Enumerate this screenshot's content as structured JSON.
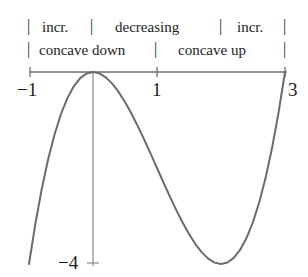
{
  "figure": {
    "curve_color": "#6b6b6b",
    "axis_color": "#6e6e6e",
    "text_color": "#1c1c1c"
  },
  "annotations": {
    "row1": [
      {
        "label": "incr.",
        "from": -1,
        "to": 0
      },
      {
        "label": "decreasing",
        "from": 0,
        "to": 2
      },
      {
        "label": "incr.",
        "from": 2,
        "to": 3
      }
    ],
    "row2": [
      {
        "label": "concave down",
        "from": -1,
        "to": 1
      },
      {
        "label": "concave up",
        "from": 1,
        "to": 3
      }
    ],
    "divider_glyph": "|"
  },
  "axes": {
    "x_ticks": [
      {
        "value": -1,
        "label": "−1"
      },
      {
        "value": 1,
        "label": "1"
      },
      {
        "value": 3,
        "label": "3"
      }
    ],
    "y_ticks": [
      {
        "value": -4,
        "label": "−4"
      }
    ]
  },
  "chart_data": {
    "type": "line",
    "title": "",
    "subtitle": "",
    "xlabel": "",
    "ylabel": "",
    "xlim": [
      -1,
      3
    ],
    "ylim": [
      -4.3,
      0.3
    ],
    "grid": false,
    "legend": null,
    "function": "y = x^3 - 3x^2",
    "series": [
      {
        "name": "y = x^3 - 3x^2",
        "color": "#6b6b6b",
        "x": [
          -1,
          -0.9,
          -0.8,
          -0.7,
          -0.6,
          -0.5,
          -0.4,
          -0.3,
          -0.2,
          -0.1,
          0,
          0.1,
          0.2,
          0.3,
          0.4,
          0.5,
          0.6,
          0.7,
          0.8,
          0.9,
          1,
          1.1,
          1.2,
          1.3,
          1.4,
          1.5,
          1.6,
          1.7,
          1.8,
          1.9,
          2,
          2.1,
          2.2,
          2.3,
          2.4,
          2.5,
          2.6,
          2.7,
          2.8,
          2.9,
          3
        ],
        "y": [
          -4,
          -3.159,
          -2.432,
          -1.813,
          -1.296,
          -0.875,
          -0.544,
          -0.297,
          -0.128,
          -0.031,
          0,
          -0.029,
          -0.112,
          -0.243,
          -0.416,
          -0.625,
          -0.864,
          -1.127,
          -1.408,
          -1.701,
          -2,
          -2.299,
          -2.592,
          -2.873,
          -3.136,
          -3.375,
          -3.584,
          -3.757,
          -3.888,
          -3.971,
          -4,
          -3.969,
          -3.872,
          -3.703,
          -3.456,
          -3.125,
          -2.704,
          -2.187,
          -1.568,
          -0.841,
          0
        ]
      }
    ],
    "key_points": [
      {
        "label": "local maximum",
        "x": 0,
        "y": 0
      },
      {
        "label": "inflection point",
        "x": 1,
        "y": -2
      },
      {
        "label": "local minimum",
        "x": 2,
        "y": -4
      },
      {
        "label": "left endpoint",
        "x": -1,
        "y": -4
      },
      {
        "label": "right endpoint",
        "x": 3,
        "y": 0
      }
    ],
    "annotations": [
      {
        "text": "incr.",
        "interval": [
          -1,
          0
        ],
        "row": 1
      },
      {
        "text": "decreasing",
        "interval": [
          0,
          2
        ],
        "row": 1
      },
      {
        "text": "incr.",
        "interval": [
          2,
          3
        ],
        "row": 1
      },
      {
        "text": "concave down",
        "interval": [
          -1,
          1
        ],
        "row": 2
      },
      {
        "text": "concave up",
        "interval": [
          1,
          3
        ],
        "row": 2
      }
    ]
  }
}
